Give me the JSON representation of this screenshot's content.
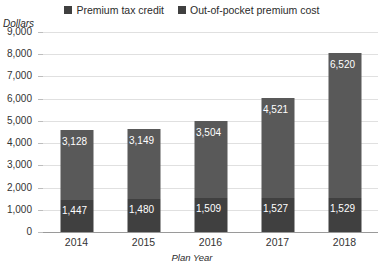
{
  "chart_data": {
    "type": "bar",
    "subtype": "stacked-column",
    "title": "",
    "xlabel": "Plan Year",
    "ylabel": "Dollars",
    "categories": [
      "2014",
      "2015",
      "2016",
      "2017",
      "2018"
    ],
    "series": [
      {
        "name": "Out-of-pocket premium cost",
        "color": "#404040",
        "values": [
          1447,
          1480,
          1509,
          1527,
          1529
        ],
        "labels": [
          "1,447",
          "1,480",
          "1,509",
          "1,527",
          "1,529"
        ]
      },
      {
        "name": "Premium tax credit",
        "color": "#595959",
        "values": [
          3128,
          3149,
          3504,
          4521,
          6520
        ],
        "labels": [
          "3,128",
          "3,149",
          "3,504",
          "4,521",
          "6,520"
        ]
      }
    ],
    "totals": [
      4575,
      4629,
      5013,
      6048,
      8049
    ],
    "ylim": [
      0,
      9000
    ],
    "ytick_step": 1000,
    "yticks": [
      0,
      1000,
      2000,
      3000,
      4000,
      5000,
      6000,
      7000,
      8000,
      9000
    ],
    "ytick_labels": [
      "0",
      "1,000",
      "2,000",
      "3,000",
      "4,000",
      "5,000",
      "6,000",
      "7,000",
      "8,000",
      "9,000"
    ],
    "grid": true,
    "legend_position": "top",
    "legend": [
      {
        "label": "Premium tax credit",
        "color": "#404040"
      },
      {
        "label": "Out-of-pocket premium cost",
        "color": "#404040"
      }
    ]
  }
}
